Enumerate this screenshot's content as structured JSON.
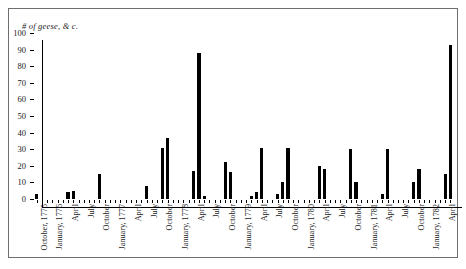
{
  "chart_data": {
    "type": "bar",
    "title": "",
    "ylabel": "# of geese, & c.",
    "xlabel": "",
    "ylim": [
      0,
      100
    ],
    "yticks": [
      0,
      10,
      20,
      30,
      40,
      50,
      60,
      70,
      80,
      90,
      100
    ],
    "grid": false,
    "legend": null,
    "tick_labels": [
      "October, 1775",
      "January, 1776",
      "April",
      "July",
      "October",
      "January, 1777",
      "April",
      "July",
      "October",
      "January, 1778",
      "April",
      "July",
      "October",
      "January, 1779",
      "April",
      "July",
      "October",
      "January, 1780",
      "April",
      "July",
      "October",
      "January, 1781",
      "April",
      "July",
      "October",
      "January, 1782",
      "April"
    ],
    "x": [
      "Oct 1775",
      "Nov 1775",
      "Dec 1775",
      "Jan 1776",
      "Feb 1776",
      "Mar 1776",
      "Apr 1776",
      "May 1776",
      "Jun 1776",
      "Jul 1776",
      "Aug 1776",
      "Sep 1776",
      "Oct 1776",
      "Nov 1776",
      "Dec 1776",
      "Jan 1777",
      "Feb 1777",
      "Mar 1777",
      "Apr 1777",
      "May 1777",
      "Jun 1777",
      "Jul 1777",
      "Aug 1777",
      "Sep 1777",
      "Oct 1777",
      "Nov 1777",
      "Dec 1777",
      "Jan 1778",
      "Feb 1778",
      "Mar 1778",
      "Apr 1778",
      "May 1778",
      "Jun 1778",
      "Jul 1778",
      "Aug 1778",
      "Sep 1778",
      "Oct 1778",
      "Nov 1778",
      "Dec 1778",
      "Jan 1779",
      "Feb 1779",
      "Mar 1779",
      "Apr 1779",
      "May 1779",
      "Jun 1779",
      "Jul 1779",
      "Aug 1779",
      "Sep 1779",
      "Oct 1779",
      "Nov 1779",
      "Dec 1779",
      "Jan 1780",
      "Feb 1780",
      "Mar 1780",
      "Apr 1780",
      "May 1780",
      "Jun 1780",
      "Jul 1780",
      "Aug 1780",
      "Sep 1780",
      "Oct 1780",
      "Nov 1780",
      "Dec 1780",
      "Jan 1781",
      "Feb 1781",
      "Mar 1781",
      "Apr 1781",
      "May 1781",
      "Jun 1781",
      "Jul 1781",
      "Aug 1781",
      "Sep 1781",
      "Oct 1781",
      "Nov 1781",
      "Dec 1781",
      "Jan 1782",
      "Feb 1782",
      "Mar 1782",
      "Apr 1782",
      "May 1782"
    ],
    "values": [
      3,
      0,
      0,
      0,
      0,
      0,
      4,
      5,
      0,
      0,
      0,
      0,
      15,
      0,
      0,
      0,
      0,
      0,
      0,
      0,
      0,
      8,
      0,
      0,
      31,
      37,
      0,
      0,
      0,
      0,
      17,
      88,
      2,
      0,
      0,
      0,
      22,
      16,
      0,
      0,
      0,
      2,
      4,
      31,
      0,
      0,
      3,
      10,
      31,
      0,
      0,
      0,
      0,
      0,
      20,
      18,
      0,
      0,
      0,
      0,
      30,
      10,
      0,
      0,
      0,
      0,
      3,
      30,
      0,
      0,
      0,
      0,
      10,
      18,
      0,
      0,
      0,
      0,
      15,
      93
    ],
    "series": [
      {
        "name": "# of geese, & c.",
        "color": "#000000",
        "values": [
          3,
          0,
          0,
          0,
          0,
          0,
          4,
          5,
          0,
          0,
          0,
          0,
          15,
          0,
          0,
          0,
          0,
          0,
          0,
          0,
          0,
          8,
          0,
          0,
          31,
          37,
          0,
          0,
          0,
          0,
          17,
          88,
          2,
          0,
          0,
          0,
          22,
          16,
          0,
          0,
          0,
          2,
          4,
          31,
          0,
          0,
          3,
          10,
          31,
          0,
          0,
          0,
          0,
          0,
          20,
          18,
          0,
          0,
          0,
          0,
          30,
          10,
          0,
          0,
          0,
          0,
          3,
          30,
          0,
          0,
          0,
          0,
          10,
          18,
          0,
          0,
          0,
          0,
          15,
          93
        ]
      }
    ]
  },
  "caption": {
    "text": ""
  },
  "colors": {
    "bar": "#000000",
    "axis": "#000000",
    "frame": "#6e6e6e"
  }
}
